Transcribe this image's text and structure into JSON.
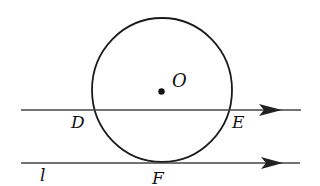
{
  "diagram": {
    "type": "geometry",
    "colors": {
      "stroke": "#1a1a1a",
      "background": "#ffffff"
    },
    "circle": {
      "center_label": "O",
      "cx": 162,
      "cy": 90,
      "rx": 70,
      "ry": 72
    },
    "lines": [
      {
        "id": "secant",
        "y": 110,
        "x_start": 21,
        "x_end": 301,
        "arrow": "right"
      },
      {
        "id": "tangent-l",
        "y": 163,
        "x_start": 21,
        "x_end": 300,
        "arrow": "right",
        "label": "l"
      }
    ],
    "labels": {
      "O": "O",
      "D": "D",
      "E": "E",
      "F": "F",
      "l": "l"
    }
  }
}
